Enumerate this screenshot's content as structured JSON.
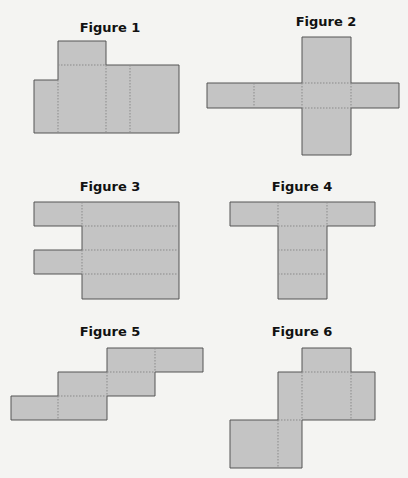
{
  "figures": [
    {
      "label": "Figure 1"
    },
    {
      "label": "Figure 2"
    },
    {
      "label": "Figure 3"
    },
    {
      "label": "Figure 4"
    },
    {
      "label": "Figure 5"
    },
    {
      "label": "Figure 6"
    }
  ],
  "colors": {
    "fill": "#c4c4c4",
    "stroke": "#555555",
    "fold": "#8a8a8a",
    "background": "#f4f4f2"
  }
}
